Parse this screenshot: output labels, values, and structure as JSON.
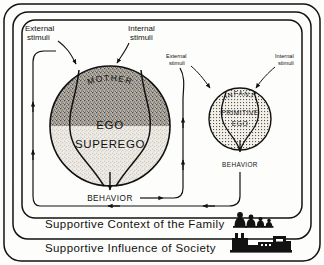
{
  "diagram": {
    "mother": {
      "circle_label": "MOTHER",
      "ego_label": "EGO",
      "superego_label": "SUPEREGO",
      "behavior_label": "BEHAVIOR",
      "external_stimuli_label_line1": "External",
      "external_stimuli_label_line2": "stimuli",
      "internal_stimuli_label_line1": "Internal",
      "internal_stimuli_label_line2": "stimuli"
    },
    "infant": {
      "circle_label": "INFANT",
      "primitive_label": "PRIMITIVE",
      "ego_label": "EGO",
      "behavior_label": "BEHAVIOR",
      "external_stimuli_label_line1": "External",
      "external_stimuli_label_line2": "stimuli",
      "internal_stimuli_label_line1": "Internal",
      "internal_stimuli_label_line2": "stimuli"
    },
    "bands": {
      "family": "Supportive Context of the Family",
      "society": "Supportive Influence of Society"
    },
    "icons": {
      "family": "family-figures-icon",
      "society": "cityscape-factory-icon"
    },
    "colors": {
      "ink": "#121212",
      "paper": "#fdfdfb",
      "ego_fill": "#a8a39c",
      "superego_fill": "#d8d4cd",
      "infant_fill": "#ddd9d2"
    }
  }
}
